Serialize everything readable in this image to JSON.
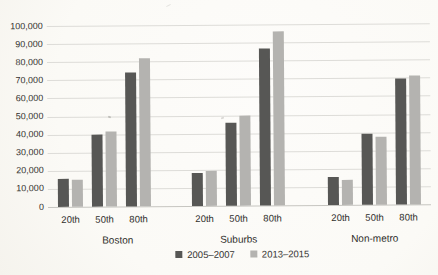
{
  "page": {
    "background": "#fbfaf7"
  },
  "chart_data": {
    "type": "bar",
    "title": "",
    "xlabel": "",
    "ylabel": "",
    "groups": [
      "Boston",
      "Suburbs",
      "Non-metro"
    ],
    "categories": [
      "20th",
      "50th",
      "80th"
    ],
    "series": [
      {
        "name": "2005–2007",
        "color": "#575755",
        "values": [
          [
            15500,
            40000,
            74000
          ],
          [
            18500,
            46000,
            86500
          ],
          [
            15500,
            39000,
            69500
          ]
        ]
      },
      {
        "name": "2013–2015",
        "color": "#b4b3b0",
        "values": [
          [
            15000,
            41500,
            81500
          ],
          [
            19500,
            49500,
            96000
          ],
          [
            14000,
            37500,
            71500
          ]
        ]
      }
    ],
    "ylim": [
      0,
      100000
    ],
    "yticks": [
      0,
      10000,
      20000,
      30000,
      40000,
      50000,
      60000,
      70000,
      80000,
      90000,
      100000
    ],
    "ytick_labels": [
      "0",
      "10,000",
      "20,000",
      "30,000",
      "40,000",
      "50,000",
      "60,000",
      "70,000",
      "80,000",
      "90,000",
      "100,000"
    ],
    "grid": true,
    "legend_position": "bottom-center"
  }
}
